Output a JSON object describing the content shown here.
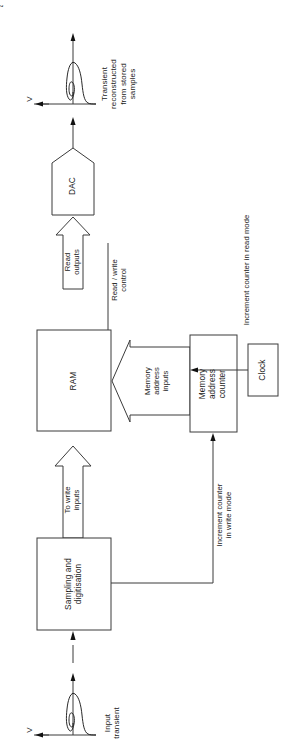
{
  "diagram": {
    "orientation": "rotated-90-ccw",
    "stroke_color": "#3b3b3b",
    "text_color": "#1a1a1a",
    "background": "#ffffff",
    "blocks": [
      {
        "id": "dac",
        "label": "DAC",
        "shape": "pentagon"
      },
      {
        "id": "ram",
        "label": "RAM",
        "shape": "rect"
      },
      {
        "id": "memory-address-counter",
        "label": "Memory\naddress\ncounter",
        "shape": "rect"
      },
      {
        "id": "clock",
        "label": "Clock",
        "shape": "rect"
      },
      {
        "id": "sampling-and-digitisation",
        "label": "Sampling and\ndigitisation",
        "shape": "rect"
      }
    ],
    "bus_arrows": [
      {
        "id": "read-outputs",
        "label": "Read\noutputs"
      },
      {
        "id": "memory-address-inputs",
        "label": "Memory\naddress\ninputs"
      },
      {
        "id": "to-write-inputs",
        "label": "To write\ninputs"
      }
    ],
    "signal_labels": [
      {
        "id": "read-write-control",
        "label": "Read / write\ncontrol"
      },
      {
        "id": "increment-counter-read",
        "label": "Increment counter in read mode"
      },
      {
        "id": "increment-counter-write",
        "label": "Increment counter\nin write mode"
      }
    ],
    "waveforms": [
      {
        "id": "output-transient",
        "caption": "Transient\nreconstructed\nfrom stored\nsamples",
        "axis_label": "V"
      },
      {
        "id": "input-transient",
        "caption": "Input\ntransient",
        "axis_label": "V"
      }
    ],
    "axis_time_label": "t"
  }
}
